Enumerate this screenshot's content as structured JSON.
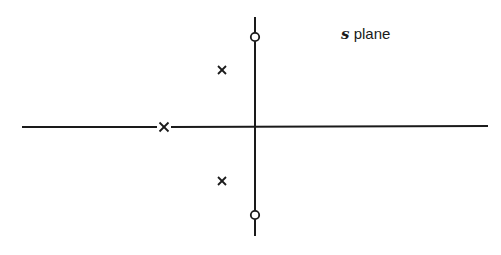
{
  "diagram": {
    "title_variable": "s",
    "title_text": "plane",
    "line_color": "#1a1a1a",
    "axes": {
      "real_axis": {
        "y": 127,
        "x_start": 22,
        "x_end": 488
      },
      "imaginary_axis": {
        "x": 255,
        "y_start": 17,
        "y_end": 236
      }
    },
    "poles": [
      {
        "label": "pole-real",
        "x": 164,
        "y": 127
      },
      {
        "label": "pole-upper",
        "x": 222,
        "y": 70
      },
      {
        "label": "pole-lower",
        "x": 222,
        "y": 181
      }
    ],
    "zeros": [
      {
        "label": "zero-upper",
        "x": 255,
        "y": 37
      },
      {
        "label": "zero-lower",
        "x": 255,
        "y": 215
      }
    ]
  }
}
